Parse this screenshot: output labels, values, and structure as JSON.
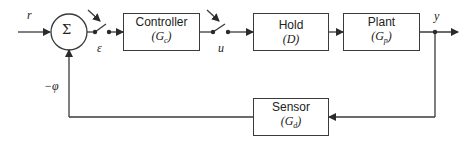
{
  "diagram": {
    "type": "feedback-control-block-diagram",
    "summing_junction": {
      "symbol": "Σ"
    },
    "signals": {
      "reference": "r",
      "error": "ε",
      "control": "u",
      "output": "y",
      "feedback": "−φ"
    },
    "blocks": [
      {
        "id": "controller",
        "title": "Controller",
        "symbol": "(Gc)",
        "sym_main": "G",
        "sym_sub": "c"
      },
      {
        "id": "hold",
        "title": "Hold",
        "symbol": "(D)",
        "sym_main": "D",
        "sym_sub": ""
      },
      {
        "id": "plant",
        "title": "Plant",
        "symbol": "(Gp)",
        "sym_main": "G",
        "sym_sub": "p"
      },
      {
        "id": "sensor",
        "title": "Sensor",
        "symbol": "(Gd)",
        "sym_main": "G",
        "sym_sub": "d"
      }
    ],
    "switches": [
      "sampler-error",
      "sampler-control"
    ],
    "colors": {
      "line": "#3a3a3a",
      "background": "#ffffff"
    }
  }
}
